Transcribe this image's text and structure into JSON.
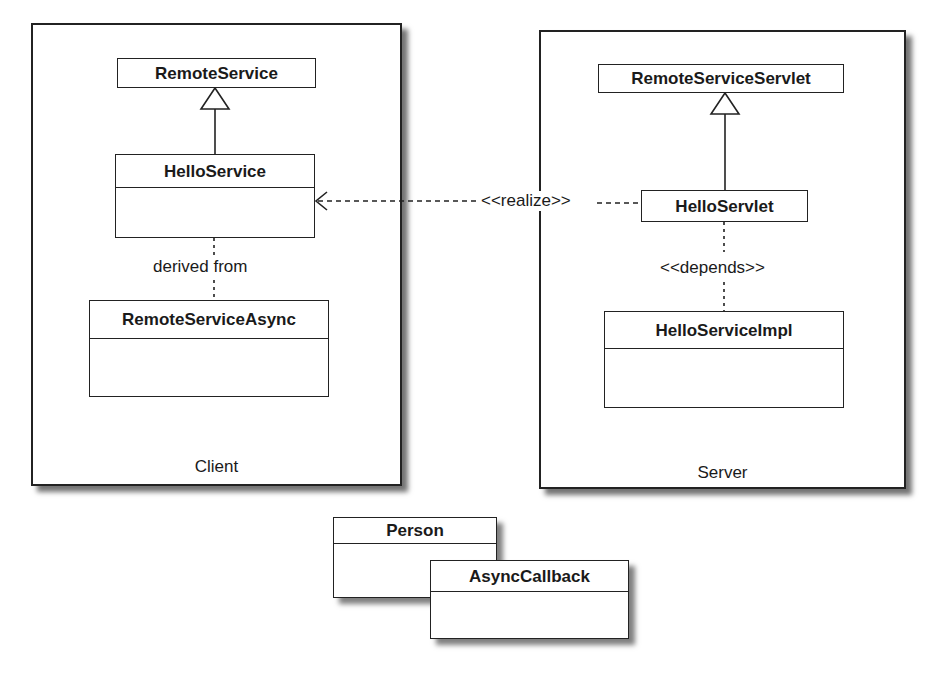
{
  "diagram": {
    "type": "uml-class-diagram",
    "panels": {
      "client": {
        "label": "Client"
      },
      "server": {
        "label": "Server"
      }
    },
    "classes": {
      "remote_service": {
        "name": "RemoteService",
        "compartments": 1
      },
      "hello_service": {
        "name": "HelloService",
        "compartments": 2
      },
      "remote_service_async": {
        "name": "RemoteServiceAsync",
        "compartments": 2
      },
      "remote_service_servlet": {
        "name": "RemoteServiceServlet",
        "compartments": 1
      },
      "hello_servlet": {
        "name": "HelloServlet",
        "compartments": 1
      },
      "hello_service_impl": {
        "name": "HelloServiceImpl",
        "compartments": 2
      },
      "person": {
        "name": "Person",
        "compartments": 2
      },
      "async_callback": {
        "name": "AsyncCallback",
        "compartments": 2
      }
    },
    "relations": {
      "derived_from": {
        "label": "derived from",
        "from": "RemoteServiceAsync",
        "to": "HelloService",
        "style": "dotted"
      },
      "realize": {
        "label": "<<realize>>",
        "from": "HelloServlet",
        "to": "HelloService",
        "style": "dashed-open-arrow"
      },
      "depends": {
        "label": "<<depends>>",
        "from": "HelloServlet",
        "to": "HelloServiceImpl",
        "style": "dotted"
      },
      "inherit_client": {
        "from": "HelloService",
        "to": "RemoteService",
        "style": "generalization"
      },
      "inherit_server": {
        "from": "HelloServlet",
        "to": "RemoteServiceServlet",
        "style": "generalization"
      }
    }
  }
}
